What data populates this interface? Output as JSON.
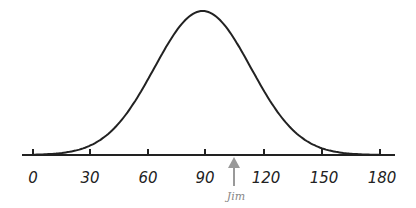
{
  "chart_data": {
    "type": "line",
    "title": "",
    "xlabel": "",
    "ylabel": "",
    "x_ticks": [
      0,
      30,
      60,
      90,
      120,
      150,
      180
    ],
    "xlim": [
      0,
      180
    ],
    "mean": 88,
    "sd": 25,
    "grid": false,
    "annotations": [
      {
        "label": "Jim",
        "x": 105,
        "type": "arrow",
        "color": "#999999"
      }
    ]
  },
  "labels": {
    "t0": "0",
    "t30": "30",
    "t60": "60",
    "t90": "90",
    "t120": "120",
    "t150": "150",
    "t180": "180",
    "jim": "Jim"
  },
  "colors": {
    "curve": "#222222",
    "arrow": "#999999"
  }
}
